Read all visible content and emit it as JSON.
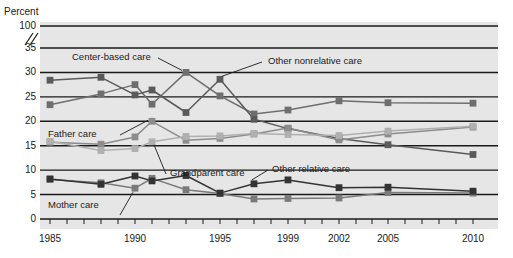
{
  "chart_data": {
    "type": "line",
    "title": "",
    "subtitle": "",
    "xlabel": "",
    "ylabel": "Percent",
    "ylim": [
      0,
      35
    ],
    "y_axis_break": {
      "below": 35,
      "above": 100,
      "marker": "//"
    },
    "grid": true,
    "grid_axis": "y",
    "legend_position": "inline-annotations",
    "x_axis_type": "categorical-years",
    "x_tick_labels": [
      "1985",
      "1990",
      "1995",
      "1999",
      "2002",
      "2005",
      "2010"
    ],
    "x_minor_ticks": [
      "1985",
      "1986",
      "1987",
      "1988",
      "1989",
      "1990",
      "1991",
      "1992",
      "1993",
      "1994",
      "1995",
      "1996",
      "1997",
      "1998",
      "1999",
      "2000",
      "2001",
      "2002",
      "2003",
      "2004",
      "2005",
      "2006",
      "2007",
      "2008",
      "2009",
      "2010"
    ],
    "y_tick_labels": [
      "0",
      "5",
      "10",
      "15",
      "20",
      "25",
      "30",
      "35",
      "100"
    ],
    "categories": [
      1985,
      1988,
      1990,
      1991,
      1993,
      1995,
      1997,
      1999,
      2002,
      2005,
      2010
    ],
    "series": [
      {
        "name": "Center-based care",
        "color": "#6e6e6e",
        "values": [
          23.4,
          25.6,
          27.5,
          23.5,
          30.0,
          25.2,
          21.5,
          22.3,
          24.2,
          23.8,
          23.7
        ]
      },
      {
        "name": "Other nonrelative care",
        "color": "#5a5a5a",
        "values": [
          28.4,
          29.0,
          25.4,
          26.4,
          21.8,
          28.6,
          20.4,
          18.5,
          16.5,
          15.2,
          13.2
        ]
      },
      {
        "name": "Father care",
        "color": "#8c8c8c",
        "values": [
          15.7,
          15.3,
          16.8,
          20.0,
          16.1,
          16.5,
          17.4,
          18.6,
          16.2,
          17.4,
          18.8
        ]
      },
      {
        "name": "Grandparent care",
        "color": "#b0b0b0",
        "values": [
          15.9,
          14.0,
          14.4,
          15.8,
          16.9,
          17.0,
          17.5,
          17.3,
          17.1,
          18.0,
          19.0
        ]
      },
      {
        "name": "Mother care",
        "color": "#7a7a7a",
        "values": [
          8.1,
          7.4,
          6.3,
          8.3,
          6.0,
          5.2,
          4.1,
          4.2,
          4.3,
          5.4,
          5.3
        ]
      },
      {
        "name": "Other relative care",
        "color": "#333333",
        "values": [
          8.2,
          7.1,
          8.8,
          7.8,
          8.9,
          5.3,
          7.2,
          8.0,
          6.4,
          6.5,
          5.7
        ]
      }
    ],
    "annotations": [
      {
        "text": "Center-based care",
        "target_series": "Center-based care"
      },
      {
        "text": "Other nonrelative care",
        "target_series": "Other nonrelative care"
      },
      {
        "text": "Father care",
        "target_series": "Father care"
      },
      {
        "text": "Grandparent care",
        "target_series": "Grandparent care"
      },
      {
        "text": "Mother care",
        "target_series": "Mother care"
      },
      {
        "text": "Other relative care",
        "target_series": "Other relative care"
      }
    ]
  },
  "axis": {
    "y_title": "Percent",
    "y_labels": [
      "100",
      "35",
      "30",
      "25",
      "20",
      "15",
      "10",
      "5",
      "0"
    ],
    "x_labels": [
      "1985",
      "1990",
      "1995",
      "1999",
      "2002",
      "2005",
      "2010"
    ]
  },
  "annotations": {
    "center_based": "Center-based care",
    "other_nonrelative": "Other nonrelative care",
    "father": "Father care",
    "grandparent": "Grandparent care",
    "mother": "Mother care",
    "other_relative": "Other relative care"
  },
  "colors": {
    "background": "#ffffff",
    "plot_background": "#e6e6e6",
    "gridline": "#1a1a1a",
    "text": "#1a1a1a",
    "center_based": "#6e6e6e",
    "other_nonrelative": "#5a5a5a",
    "father": "#8c8c8c",
    "grandparent": "#b0b0b0",
    "mother": "#7a7a7a",
    "other_relative": "#333333"
  }
}
